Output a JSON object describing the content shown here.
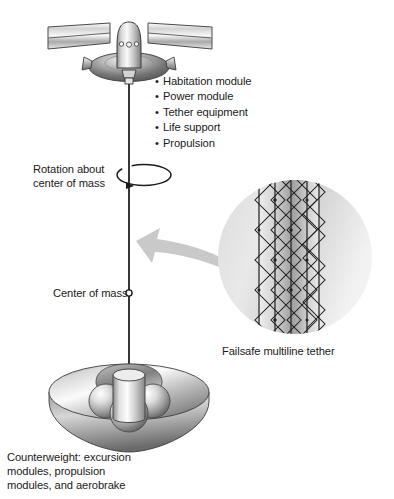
{
  "diagram": {
    "background_color": "#ffffff",
    "ink_color": "#1b1b1b",
    "metal_light": "#f2f2f2",
    "metal_mid": "#bfbfbf",
    "metal_dark": "#6e6e6e",
    "arrow_gray": "#c9c9c9",
    "circle_gray": "#e3e3e3",
    "width": 394,
    "height": 499
  },
  "spacecraft": {
    "name": "habitat spacecraft",
    "modules_heading": "",
    "modules": [
      "Habitation module",
      "Power module",
      "Tether equipment",
      "Life support",
      "Propulsion"
    ],
    "bullet_glyph": "•",
    "parts": {
      "solar_panel_left": "solar-panel-left",
      "solar_panel_right": "solar-panel-right",
      "capsule": "crew-capsule",
      "saucer": "service-saucer",
      "thruster_left": "thruster-left",
      "thruster_right": "thruster-right",
      "tether_attachment": "tether-attachment"
    },
    "capsule_window_count": 3
  },
  "rotation": {
    "label_line1": "Rotation about",
    "label_line2": "center of mass",
    "label_full": "Rotation about\ncenter of mass",
    "arrow_direction": "counterclockwise"
  },
  "center_of_mass": {
    "label": "Center of mass",
    "marker": "small-circle"
  },
  "tether_detail": {
    "caption": "Failsafe multiline tether",
    "magnifier_shape": "circle",
    "primary_line_count": 4,
    "crosslink_pattern": "diamond-mesh",
    "callout_arrow": "points-left-to-tether"
  },
  "counterweight": {
    "caption_line1": "Counterweight: excursion",
    "caption_line2": "modules, propulsion",
    "caption_line3": "modules, and aerobrake",
    "caption_full": "Counterweight: excursion\nmodules, propulsion\nmodules, and aerobrake",
    "parts": {
      "aerobrake_dish": "aerobrake-dish",
      "central_cylinder": "propulsion-cylinder",
      "sphere_count": 3,
      "spheres": "excursion-module-spheres"
    }
  },
  "tether": {
    "name": "main-tether-line",
    "top_y": 86,
    "bottom_y": 370
  }
}
